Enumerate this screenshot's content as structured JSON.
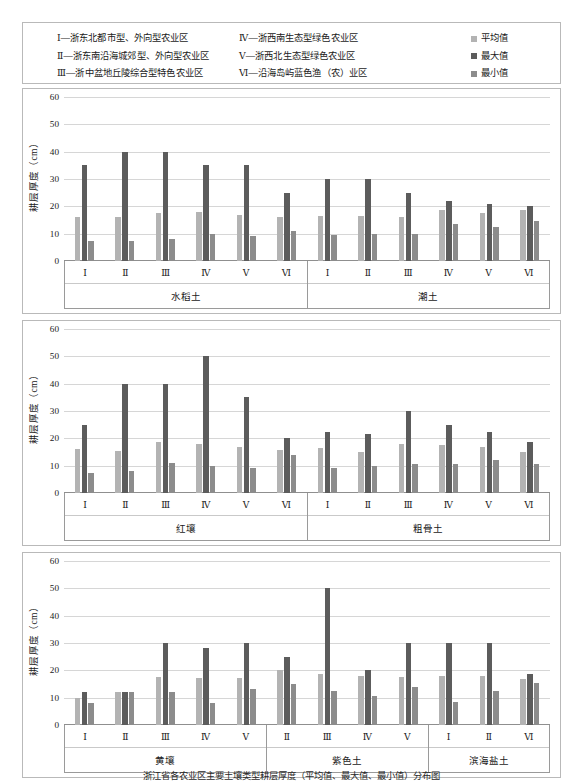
{
  "legend": {
    "zone_col1": [
      "Ⅰ—浙东北都市型、外向型农业区",
      "Ⅱ—浙东南沿海城郊型、外向型农业区",
      "Ⅲ—浙中盆地丘陵综合型特色农业区"
    ],
    "zone_col2": [
      "Ⅳ—浙西南生态型绿色农业区",
      "Ⅴ—浙西北生态型绿色农业区",
      "Ⅵ—沿海岛屿蓝色渔（农）业区"
    ],
    "series": [
      {
        "label": "平均值",
        "color": "#b3b3b3"
      },
      {
        "label": "最大值",
        "color": "#5c5c5c"
      },
      {
        "label": "最小值",
        "color": "#8c8c8c"
      }
    ]
  },
  "caption": "浙江省各农业区主要土壤类型耕层厚度（平均值、最大值、最小值）分布图",
  "axis": {
    "ylabel": "耕层厚度（cm）",
    "yticks": [
      0,
      10,
      20,
      30,
      40,
      50,
      60
    ],
    "ymin": 0,
    "ymax": 60
  },
  "chart_data": {
    "type": "bar",
    "title": "",
    "xlabel": "",
    "ylabel": "耕层厚度（cm）",
    "ylim": [
      0,
      60
    ],
    "grid": true,
    "legend_position": "top-right",
    "series_names": [
      "平均值",
      "最大值",
      "最小值"
    ],
    "panels": [
      {
        "index": 0,
        "soils": [
          {
            "name": "水稻土",
            "categories": [
              "Ⅰ",
              "Ⅱ",
              "Ⅲ",
              "Ⅳ",
              "Ⅴ",
              "Ⅵ"
            ],
            "series": [
              {
                "name": "平均值",
                "values": [
                  16.0,
                  16.2,
                  17.5,
                  17.8,
                  17.0,
                  16.2
                ]
              },
              {
                "name": "最大值",
                "values": [
                  35.0,
                  40.0,
                  40.0,
                  35.0,
                  35.0,
                  25.0
                ]
              },
              {
                "name": "最小值",
                "values": [
                  7.2,
                  7.2,
                  8.0,
                  10.0,
                  9.0,
                  11.0
                ]
              }
            ]
          },
          {
            "name": "潮土",
            "categories": [
              "Ⅰ",
              "Ⅱ",
              "Ⅲ",
              "Ⅳ",
              "Ⅴ",
              "Ⅵ"
            ],
            "series": [
              {
                "name": "平均值",
                "values": [
                  16.5,
                  16.5,
                  16.0,
                  18.5,
                  17.5,
                  18.5
                ]
              },
              {
                "name": "最大值",
                "values": [
                  30.0,
                  30.0,
                  25.0,
                  22.0,
                  21.0,
                  20.0
                ]
              },
              {
                "name": "最小值",
                "values": [
                  9.5,
                  10.0,
                  10.0,
                  13.5,
                  12.5,
                  14.5
                ]
              }
            ]
          }
        ]
      },
      {
        "index": 1,
        "soils": [
          {
            "name": "红壤",
            "categories": [
              "Ⅰ",
              "Ⅱ",
              "Ⅲ",
              "Ⅳ",
              "Ⅴ",
              "Ⅵ"
            ],
            "series": [
              {
                "name": "平均值",
                "values": [
                  16.0,
                  15.5,
                  18.5,
                  18.0,
                  16.8,
                  15.8
                ]
              },
              {
                "name": "最大值",
                "values": [
                  25.0,
                  40.0,
                  40.0,
                  50.0,
                  35.0,
                  20.0
                ]
              },
              {
                "name": "最小值",
                "values": [
                  7.2,
                  8.0,
                  11.0,
                  10.0,
                  9.2,
                  14.0
                ]
              }
            ]
          },
          {
            "name": "粗骨土",
            "categories": [
              "Ⅰ",
              "Ⅱ",
              "Ⅲ",
              "Ⅳ",
              "Ⅴ",
              "Ⅵ"
            ],
            "series": [
              {
                "name": "平均值",
                "values": [
                  16.5,
                  15.0,
                  18.0,
                  17.5,
                  17.0,
                  15.0
                ]
              },
              {
                "name": "最大值",
                "values": [
                  22.5,
                  21.5,
                  30.0,
                  25.0,
                  22.5,
                  18.5
                ]
              },
              {
                "name": "最小值",
                "values": [
                  9.0,
                  10.0,
                  10.5,
                  10.5,
                  12.0,
                  10.5
                ]
              }
            ]
          }
        ]
      },
      {
        "index": 2,
        "soils": [
          {
            "name": "黄壤",
            "categories": [
              "Ⅰ",
              "Ⅱ",
              "Ⅲ",
              "Ⅳ",
              "Ⅴ"
            ],
            "series": [
              {
                "name": "平均值",
                "values": [
                  10.0,
                  12.0,
                  17.5,
                  17.2,
                  17.2
                ]
              },
              {
                "name": "最大值",
                "values": [
                  12.0,
                  12.0,
                  30.0,
                  28.0,
                  30.0
                ]
              },
              {
                "name": "最小值",
                "values": [
                  8.2,
                  12.0,
                  12.0,
                  8.2,
                  13.0
                ]
              }
            ]
          },
          {
            "name": "紫色土",
            "categories": [
              "Ⅱ",
              "Ⅲ",
              "Ⅳ",
              "Ⅴ"
            ],
            "series": [
              {
                "name": "平均值",
                "values": [
                  20.0,
                  18.5,
                  18.0,
                  17.5
                ]
              },
              {
                "name": "最大值",
                "values": [
                  25.0,
                  50.0,
                  20.0,
                  30.0
                ]
              },
              {
                "name": "最小值",
                "values": [
                  15.0,
                  12.5,
                  10.5,
                  14.0
                ]
              }
            ]
          },
          {
            "name": "滨海盐土",
            "categories": [
              "Ⅰ",
              "Ⅱ",
              "Ⅵ"
            ],
            "series": [
              {
                "name": "平均值",
                "values": [
                  18.0,
                  18.0,
                  17.0
                ]
              },
              {
                "name": "最大值",
                "values": [
                  30.0,
                  30.0,
                  18.5
                ]
              },
              {
                "name": "最小值",
                "values": [
                  8.5,
                  12.5,
                  15.5
                ]
              }
            ]
          }
        ]
      }
    ]
  }
}
